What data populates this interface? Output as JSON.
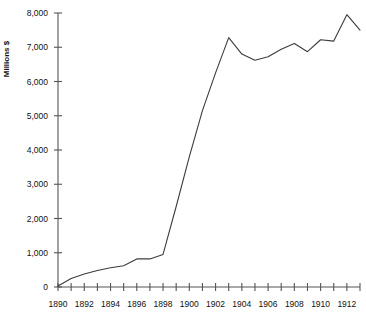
{
  "chart_data": {
    "type": "line",
    "title": "",
    "xlabel": "",
    "ylabel": "Millions $",
    "xlim": [
      1890,
      1913
    ],
    "ylim": [
      0,
      8000
    ],
    "grid": false,
    "legend": null,
    "y_ticks": [
      0,
      1000,
      2000,
      3000,
      4000,
      5000,
      6000,
      7000,
      8000
    ],
    "y_tick_labels": [
      "0",
      "1,000",
      "2,000",
      "3,000",
      "4,000",
      "5,000",
      "6,000",
      "7,000",
      "8,000"
    ],
    "x_ticks": [
      1890,
      1891,
      1892,
      1893,
      1894,
      1895,
      1896,
      1897,
      1898,
      1899,
      1900,
      1901,
      1902,
      1903,
      1904,
      1905,
      1906,
      1907,
      1908,
      1909,
      1910,
      1911,
      1912,
      1913
    ],
    "x_tick_labels": [
      "1890",
      "",
      "1892",
      "",
      "1894",
      "",
      "1896",
      "",
      "1898",
      "",
      "1900",
      "",
      "1902",
      "",
      "1904",
      "",
      "1906",
      "",
      "1908",
      "",
      "1910",
      "",
      "1912",
      ""
    ],
    "x": [
      1890,
      1891,
      1892,
      1893,
      1894,
      1895,
      1896,
      1897,
      1898,
      1899,
      1900,
      1901,
      1902,
      1903,
      1904,
      1905,
      1906,
      1907,
      1908,
      1909,
      1910,
      1911,
      1912,
      1913
    ],
    "values": [
      30,
      250,
      380,
      480,
      560,
      620,
      820,
      820,
      950,
      2350,
      3800,
      5150,
      6250,
      7280,
      6800,
      6620,
      6720,
      6940,
      7110,
      6870,
      7220,
      7180,
      7950,
      7500
    ],
    "series": [
      {
        "name": "Millions $",
        "color": "#3c3c3c",
        "values": [
          30,
          250,
          380,
          480,
          560,
          620,
          820,
          820,
          950,
          2350,
          3800,
          5150,
          6250,
          7280,
          6800,
          6620,
          6720,
          6940,
          7110,
          6870,
          7220,
          7180,
          7950,
          7500
        ]
      }
    ]
  },
  "colors": {
    "line": "#3c3c3c",
    "axis": "#555555",
    "text": "#111111",
    "background": "#ffffff"
  }
}
